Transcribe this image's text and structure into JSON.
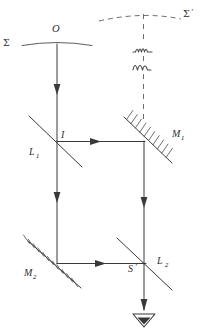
{
  "figure": {
    "background_color": "#ffffff",
    "line_color": "#3a3a3c",
    "dashed_color": "#6b6b70",
    "label_color": "#2e2e30",
    "width": 208,
    "height": 334
  },
  "labels": {
    "sigma": "Σ",
    "sigma_prime": "Σ",
    "sigma_prime_mark": "′",
    "source_point": "O",
    "image_point": "I",
    "beamsplitter_1": "L",
    "beamsplitter_1_sub": "1",
    "beamsplitter_2": "L",
    "beamsplitter_2_sub": "2",
    "mirror_1": "M",
    "mirror_1_sub": "1",
    "mirror_2": "M",
    "mirror_2_sub": "2",
    "screen_point": "S",
    "screen_point_mark": "′"
  },
  "elements": {
    "wavefront_sigma": {
      "name": "sigma-wavefront-curve",
      "kind": "curve",
      "description": "solid shallow arc labelled Sigma passing through point O"
    },
    "wavefront_sigma_prime": {
      "name": "sigma-prime-wavefront-curve",
      "kind": "dashed-curve",
      "description": "dashed shallow arc labelled Sigma-prime at top right"
    },
    "wave_symbols": {
      "name": "wave-squiggle",
      "count": 2,
      "description": "two small squiggle wave glyphs on the dashed vertical axis"
    },
    "detector": {
      "name": "eye-detector-icon",
      "description": "downward pointing triangle eye symbol at bottom of output beam"
    }
  },
  "rays": [
    {
      "id": "ray-source-down",
      "name": "ray-source-to-splitter",
      "direction": "down",
      "from": "O",
      "to": "I"
    },
    {
      "id": "ray-split-right",
      "name": "ray-splitter-to-mirror1",
      "direction": "right",
      "from": "I",
      "to": "M1"
    },
    {
      "id": "ray-split-down",
      "name": "ray-splitter-to-mirror2",
      "direction": "down",
      "from": "I",
      "to": "M2"
    },
    {
      "id": "ray-m1-down",
      "name": "ray-mirror1-to-splitter2",
      "direction": "down",
      "from": "M1",
      "to": "S'"
    },
    {
      "id": "ray-m2-right",
      "name": "ray-mirror2-to-splitter2",
      "direction": "right",
      "from": "M2",
      "to": "S'"
    },
    {
      "id": "ray-out-down",
      "name": "ray-splitter2-to-detector",
      "direction": "down",
      "from": "S'",
      "to": "detector"
    }
  ]
}
